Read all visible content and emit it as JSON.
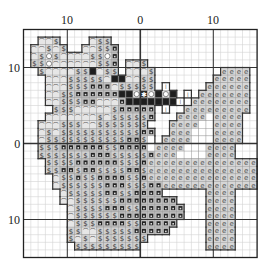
{
  "chart_title": "",
  "axis_labels": {
    "top": [
      {
        "text": "10",
        "col": 6
      },
      {
        "text": "0",
        "col": 16
      },
      {
        "text": "10",
        "col": 26
      }
    ],
    "left": [
      {
        "text": "10",
        "row": 5
      },
      {
        "text": "0",
        "row": 15
      },
      {
        "text": "10",
        "row": 25
      }
    ]
  },
  "grid": {
    "cols": 32,
    "rows": 30,
    "left": 23.5,
    "top": 29.5,
    "cell_w": 7.3,
    "cell_h": 7.6,
    "major_every": 10,
    "major_offset_col": 6,
    "major_offset_row": 5,
    "axis_col": 16,
    "axis_row": 15
  },
  "colors": {
    "minor_grid": "#d4d4d4",
    "major_grid": "#333333",
    "border": "#222222",
    "outline": "#333333",
    "light_fill": "#e6e6e6",
    "mid_fill": "#c8c8c8",
    "dark_fill": "#9a9a9a",
    "black": "#222222",
    "e_fill": "#d6d6d6",
    "white_fill": "#ffffff"
  },
  "legend": {
    "~": {
      "name": "light-squiggle",
      "glyph": "ꟹ",
      "fill": "#e6e6e6"
    },
    "$": {
      "name": "dollar",
      "glyph": "$",
      "fill": "#cfcfcf"
    },
    "n": {
      "name": "dark-square",
      "glyph": "■",
      "fill": "#bdbdbd"
    },
    "B": {
      "name": "solid-black",
      "glyph": "■",
      "fill": "#3a3a3a"
    },
    "o": {
      "name": "white-circle",
      "glyph": "○",
      "fill": "#e6e6e6"
    },
    "*": {
      "name": "asterisk",
      "glyph": "✱",
      "fill": "#bdbdbd"
    },
    "e": {
      "name": "e-symbol",
      "glyph": "e",
      "fill": "#d6d6d6"
    },
    "w": {
      "name": "white",
      "glyph": "",
      "fill": "#ffffff"
    },
    "l": {
      "name": "white-line",
      "glyph": "l",
      "fill": "#ffffff"
    }
  },
  "chart_data": {
    "type": "heatmap",
    "title": "",
    "xlabel": "",
    "ylabel": "",
    "x_ticks": [
      "10",
      "0",
      "10"
    ],
    "y_ticks": [
      "10",
      "0",
      "10"
    ],
    "grid": true,
    "cells": [
      "................................",
      "..~~$....~$$....................",
      ".~~$~$..~~$$n...................",
      ".~$o$~~~~$$on...................",
      ".$$o~~~~~~$$n.~~$...............",
      "..$~~~~$$B~$$.~~~$.........eeee.",
      "...~~~$$$$$~BB~~$$........eeeee.",
      "...~~~$$$nnn~$$$$$.l.....eeeeee.",
      "...~~$$nnnnnnBBo*oBoB.l.eeeeeee.",
      "...~~$$$nn~~~nBBBBBBBl.eeeeeeee.",
      "....$$$~~~~~$nnnnn.l..eeeeeeeee.",
      "...~~~~~~~$~$$$$$n...eeeeweeee..",
      "..~~~$$$~~$$$$$$$...eeeewweeee..",
      "..~$~$$$$$$$$$$$nn..eeewwweeee..",
      "..~$$$$$$$$$$$nn$w.eeeewwweeee..",
      "..$$$nnnnnn$$nnnnweeeewwweeee...",
      "..$$$$$$$nnn$$$$$neeewwwweeee...",
      "...$$$$nnnnnn$$$neeeeeeeeeeeeeee",
      "...$$nn$nn$$$$nn$eeeeeeeeeeeeeee",
      "....~$$n$$nnnn$$neeeeeeeeeeeeeee",
      "....~$$$$$$nnn$$$nneeeeeeeeeeeee",
      ".....~$$$$$nn$$nnnn......eeee...",
      ".....~~$$$$$$nnnnnnnn....eeee...",
      "......~$$$$nnn$$nnnnnn...eeee...",
      "......~$$$$$$nnnnnnnnn...eeee...",
      "......~$$$nnnn$$nnnnn....eeee...",
      "......$$~~$$$$$nnnnn.....eeee...",
      "......$~$~$$$$$$$........eeee...",
      ".......$$$$$$$$$.........eeee...",
      "................................"
    ]
  }
}
